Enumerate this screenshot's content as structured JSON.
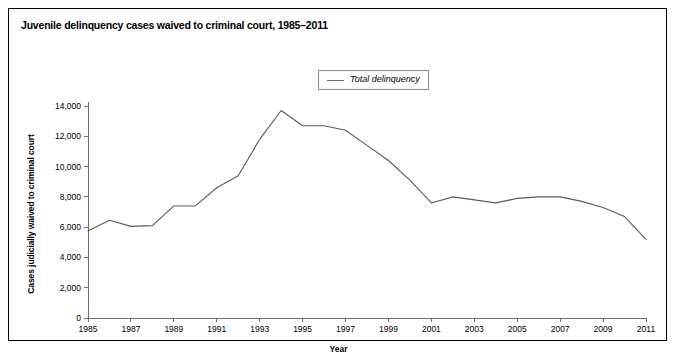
{
  "figure": {
    "title": "Juvenile delinquency cases waived to criminal court, 1985–2011",
    "border_color": "#000000",
    "background": "#ffffff"
  },
  "legend": {
    "position": "top-center",
    "entries": [
      {
        "label": "Total delinquency",
        "color": "#6e6e6e",
        "style": "line"
      }
    ]
  },
  "axes": {
    "xlabel": "Year",
    "ylabel": "Cases judicially waived to criminal court",
    "x_ticks": [
      "1985",
      "1987",
      "1989",
      "1991",
      "1993",
      "1995",
      "1997",
      "1999",
      "2001",
      "2003",
      "2005",
      "2007",
      "2009",
      "2011"
    ],
    "y_ticks": [
      "0",
      "2,000",
      "4,000",
      "6,000",
      "8,000",
      "10,000",
      "12,000",
      "14,000"
    ],
    "xlim": [
      1985,
      2011
    ],
    "ylim": [
      0,
      14000
    ],
    "grid": false
  },
  "chart_data": {
    "type": "line",
    "title": "Juvenile delinquency cases waived to criminal court, 1985–2011",
    "xlabel": "Year",
    "ylabel": "Cases judicially waived to criminal court",
    "xlim": [
      1985,
      2011
    ],
    "ylim": [
      0,
      14000
    ],
    "grid": false,
    "legend_position": "top-center",
    "x": [
      1985,
      1986,
      1987,
      1988,
      1989,
      1990,
      1991,
      1992,
      1993,
      1994,
      1995,
      1996,
      1997,
      1998,
      1999,
      2000,
      2001,
      2002,
      2003,
      2004,
      2005,
      2006,
      2007,
      2008,
      2009,
      2010,
      2011
    ],
    "x_tick_labels": [
      "1985",
      "1987",
      "1989",
      "1991",
      "1993",
      "1995",
      "1997",
      "1999",
      "2001",
      "2003",
      "2005",
      "2007",
      "2009",
      "2011"
    ],
    "y_tick_values": [
      0,
      2000,
      4000,
      6000,
      8000,
      10000,
      12000,
      14000
    ],
    "y_tick_labels": [
      "0",
      "2,000",
      "4,000",
      "6,000",
      "8,000",
      "10,000",
      "12,000",
      "14,000"
    ],
    "series": [
      {
        "name": "Total delinquency",
        "color": "#6e6e6e",
        "values": [
          5750,
          6450,
          6050,
          6100,
          7400,
          7400,
          8600,
          9400,
          11800,
          13700,
          12700,
          12700,
          12400,
          11400,
          10400,
          9100,
          7600,
          8000,
          7800,
          7600,
          7900,
          8000,
          8000,
          7700,
          7300,
          6700,
          5200
        ]
      }
    ]
  }
}
